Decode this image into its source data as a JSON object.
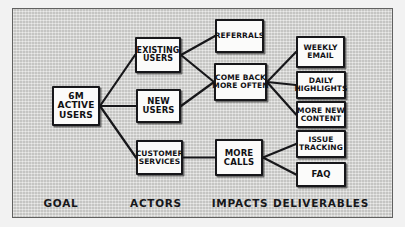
{
  "diagram": {
    "background_color": "#d3d3d1",
    "ink_color": "#17171a",
    "node_fill": "#fbfbfa",
    "columns": [
      {
        "id": "goal",
        "label": "GOAL",
        "x": 61
      },
      {
        "id": "actors",
        "label": "ACTORS",
        "x": 156
      },
      {
        "id": "impacts",
        "label": "IMPACTS",
        "x": 240
      },
      {
        "id": "deliverables",
        "label": "DELIVERABLES",
        "x": 321
      }
    ],
    "nodes": [
      {
        "id": "goal-6m-active-users",
        "column": "goal",
        "lines": [
          "6M",
          "ACTIVE",
          "USERS"
        ],
        "x": 52,
        "y": 86,
        "w": 48,
        "h": 40,
        "font": 9
      },
      {
        "id": "actor-existing-users",
        "column": "actors",
        "lines": [
          "EXISTING",
          "USERS"
        ],
        "x": 135,
        "y": 37,
        "w": 46,
        "h": 36,
        "font": 8
      },
      {
        "id": "actor-new-users",
        "column": "actors",
        "lines": [
          "NEW",
          "USERS"
        ],
        "x": 136,
        "y": 89,
        "w": 45,
        "h": 34,
        "font": 8.5
      },
      {
        "id": "actor-customer-services",
        "column": "actors",
        "lines": [
          "CUSTOMER",
          "SERVICES"
        ],
        "x": 136,
        "y": 140,
        "w": 47,
        "h": 35,
        "font": 7.5
      },
      {
        "id": "impact-referrals",
        "column": "impacts",
        "lines": [
          "REFERRALS"
        ],
        "x": 215,
        "y": 19,
        "w": 49,
        "h": 34,
        "font": 7.5
      },
      {
        "id": "impact-come-back-more-often",
        "column": "impacts",
        "lines": [
          "COME BACK",
          "MORE OFTEN"
        ],
        "x": 214,
        "y": 63,
        "w": 53,
        "h": 38,
        "font": 7.5
      },
      {
        "id": "impact-more-calls",
        "column": "impacts",
        "lines": [
          "MORE",
          "CALLS"
        ],
        "x": 215,
        "y": 139,
        "w": 48,
        "h": 37,
        "font": 8.5
      },
      {
        "id": "deliverable-weekly-email",
        "column": "deliverables",
        "lines": [
          "WEEKLY",
          "EMAIL"
        ],
        "x": 296,
        "y": 36,
        "w": 49,
        "h": 32,
        "font": 7.5
      },
      {
        "id": "deliverable-daily-highlights",
        "column": "deliverables",
        "lines": [
          "DAILY",
          "HIGHLIGHTS"
        ],
        "x": 296,
        "y": 71,
        "w": 50,
        "h": 28,
        "font": 7.5
      },
      {
        "id": "deliverable-more-new-content",
        "column": "deliverables",
        "lines": [
          "MORE NEW",
          "CONTENT"
        ],
        "x": 296,
        "y": 101,
        "w": 50,
        "h": 27,
        "font": 7.5
      },
      {
        "id": "deliverable-issue-tracking",
        "column": "deliverables",
        "lines": [
          "ISSUE",
          "TRACKING"
        ],
        "x": 296,
        "y": 130,
        "w": 50,
        "h": 28,
        "font": 7.5
      },
      {
        "id": "deliverable-faq",
        "column": "deliverables",
        "lines": [
          "FAQ"
        ],
        "x": 296,
        "y": 162,
        "w": 50,
        "h": 25,
        "font": 8.5
      }
    ],
    "links": [
      {
        "from": "goal-6m-active-users",
        "to": "actor-existing-users"
      },
      {
        "from": "goal-6m-active-users",
        "to": "actor-new-users"
      },
      {
        "from": "goal-6m-active-users",
        "to": "actor-customer-services"
      },
      {
        "from": "actor-existing-users",
        "to": "impact-referrals"
      },
      {
        "from": "actor-existing-users",
        "to": "impact-come-back-more-often"
      },
      {
        "from": "actor-new-users",
        "to": "impact-come-back-more-often"
      },
      {
        "from": "actor-customer-services",
        "to": "impact-more-calls"
      },
      {
        "from": "impact-come-back-more-often",
        "to": "deliverable-weekly-email"
      },
      {
        "from": "impact-come-back-more-often",
        "to": "deliverable-daily-highlights"
      },
      {
        "from": "impact-come-back-more-often",
        "to": "deliverable-more-new-content"
      },
      {
        "from": "impact-more-calls",
        "to": "deliverable-issue-tracking"
      },
      {
        "from": "impact-more-calls",
        "to": "deliverable-faq"
      }
    ]
  }
}
